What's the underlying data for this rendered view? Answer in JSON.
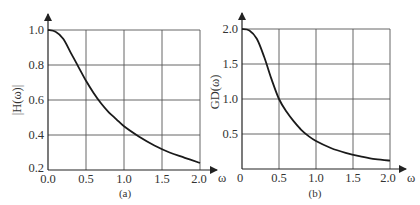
{
  "chart_data": [
    {
      "type": "line",
      "panel": "(a)",
      "xlabel": "ω",
      "ylabel": "|H(ω)|",
      "xlim": [
        0.0,
        2.0
      ],
      "ylim": [
        0.2,
        1.0
      ],
      "xticks": [
        "0.0",
        "0.5",
        "1.0",
        "1.5",
        "2.0"
      ],
      "yticks": [
        "0.2",
        "0.4",
        "0.6",
        "0.8",
        "1.0"
      ],
      "grid": true,
      "series": [
        {
          "name": "|H(ω)|",
          "x": [
            0.0,
            0.1,
            0.2,
            0.3,
            0.4,
            0.5,
            0.6,
            0.7,
            0.8,
            0.9,
            1.0,
            1.2,
            1.4,
            1.6,
            1.8,
            2.0
          ],
          "y": [
            1.0,
            0.99,
            0.95,
            0.87,
            0.79,
            0.71,
            0.64,
            0.58,
            0.53,
            0.49,
            0.45,
            0.39,
            0.34,
            0.3,
            0.27,
            0.24
          ]
        }
      ]
    },
    {
      "type": "line",
      "panel": "(b)",
      "xlabel": "ω",
      "ylabel": "GD(ω)",
      "xlim": [
        0,
        2.0
      ],
      "ylim": [
        0,
        2.0
      ],
      "xticks": [
        "0",
        "0.5",
        "1.0",
        "1.5",
        "2.0"
      ],
      "yticks": [
        "0.5",
        "1.0",
        "1.5",
        "2.0"
      ],
      "grid": true,
      "series": [
        {
          "name": "GD(ω)",
          "x": [
            0.0,
            0.1,
            0.2,
            0.3,
            0.4,
            0.5,
            0.6,
            0.7,
            0.8,
            0.9,
            1.0,
            1.2,
            1.4,
            1.6,
            1.8,
            2.0
          ],
          "y": [
            2.0,
            1.98,
            1.86,
            1.6,
            1.28,
            1.0,
            0.82,
            0.68,
            0.56,
            0.47,
            0.4,
            0.3,
            0.23,
            0.18,
            0.14,
            0.12
          ]
        }
      ]
    }
  ],
  "captions": {
    "a": "(a)",
    "b": "(b)"
  },
  "axis_labels": {
    "a_x": "ω",
    "a_y": "|H(ω)|",
    "b_x": "ω",
    "b_y": "GD(ω)"
  },
  "ticks": {
    "a_x": [
      "0.0",
      "0.5",
      "1.0",
      "1.5",
      "2.0"
    ],
    "a_y": [
      "1.0",
      "0.8",
      "0.6",
      "0.4",
      "0.2"
    ],
    "b_x": [
      "0",
      "0.5",
      "1.0",
      "1.5",
      "2.0"
    ],
    "b_y": [
      "2.0",
      "1.5",
      "1.0",
      "0.5"
    ]
  }
}
